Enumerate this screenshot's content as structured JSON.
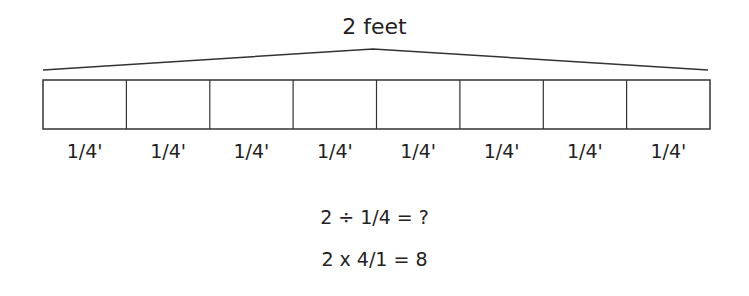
{
  "diagram": {
    "total_label": "2 feet",
    "segments": [
      "1/4'",
      "1/4'",
      "1/4'",
      "1/4'",
      "1/4'",
      "1/4'",
      "1/4'",
      "1/4'"
    ],
    "equations": [
      "2 ÷ 1/4 = ?",
      "2 x 4/1 = 8"
    ]
  }
}
